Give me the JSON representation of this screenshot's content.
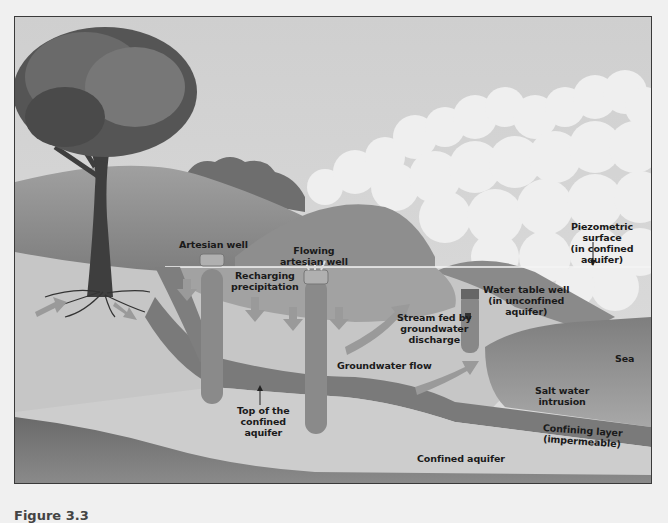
{
  "diagram": {
    "caption": "Figure 3.3",
    "labels": {
      "artesian_well": "Artesian well",
      "flowing_artesian_well": "Flowing\nartesian well",
      "recharging_precipitation": "Recharging\nprecipitation",
      "piezometric_surface": "Piezometric surface\n(in confined aquifer)",
      "water_table_well": "Water table well\n(in unconfined\naquifer)",
      "stream_fed": "Stream fed by\ngroundwater\ndischarge",
      "groundwater_flow": "Groundwater flow",
      "sea": "Sea",
      "salt_water_intrusion": "Salt water\nintrusion",
      "confining_layer": "Confining layer (impermeable)",
      "top_of_confined_aquifer": "Top of the\nconfined\naquifer",
      "confined_aquifer": "Confined aquifer"
    },
    "colors": {
      "background": "#f0f0f0",
      "sky": "#d4d4d4",
      "cloud": "#efefef",
      "hill_dark": "#8a8a8a",
      "hill_mid": "#a4a4a4",
      "unconfined_aquifer": "#c4c4c4",
      "confining_layer": "#7a7a7a",
      "confined_aquifer": "#cdcdcd",
      "bedrock": "#6e6e6e",
      "sea": "#8f8f8f",
      "well": "#8c8c8c",
      "arrow": "#9a9a9a",
      "frame_border": "#3a3a3a"
    }
  }
}
